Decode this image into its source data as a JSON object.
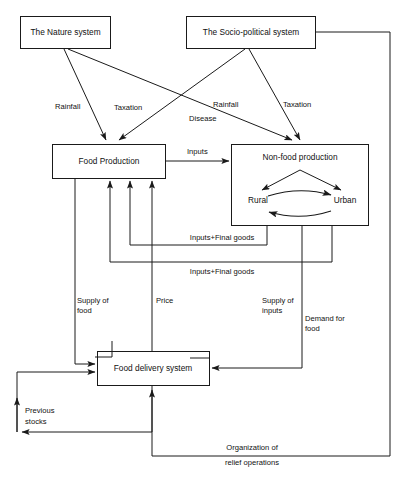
{
  "diagram": {
    "stroke_color": "#1a1a1a",
    "background_color": "#ffffff",
    "nodes": [
      {
        "id": "nature",
        "label": "The Nature system"
      },
      {
        "id": "socio",
        "label": "The Socio-political system"
      },
      {
        "id": "food_prod",
        "label": "Food Production"
      },
      {
        "id": "nonfood",
        "label": "Non-food production"
      },
      {
        "id": "rural",
        "label": "Rural"
      },
      {
        "id": "urban",
        "label": "Urban"
      },
      {
        "id": "delivery",
        "label": "Food delivery system"
      }
    ],
    "edge_labels": {
      "rainfall_left": "Rainfall",
      "taxation_left": "Taxation",
      "rainfall_right": "Rainfall",
      "disease": "Disease",
      "taxation_right": "Taxation",
      "inputs": "Inputs",
      "inputs_final_goods_1": "Inputs+Final goods",
      "inputs_final_goods_2": "Inputs+Final goods",
      "supply_of_food_1": "Supply of",
      "supply_of_food_2": "food",
      "price": "Price",
      "supply_of_inputs_1": "Supply of",
      "supply_of_inputs_2": "inputs",
      "demand_for_food_1": "Demand for",
      "demand_for_food_2": "food",
      "previous_stocks_1": "Previous",
      "previous_stocks_2": "stocks",
      "organization_1": "Organization of",
      "organization_2": "relief operations"
    }
  }
}
